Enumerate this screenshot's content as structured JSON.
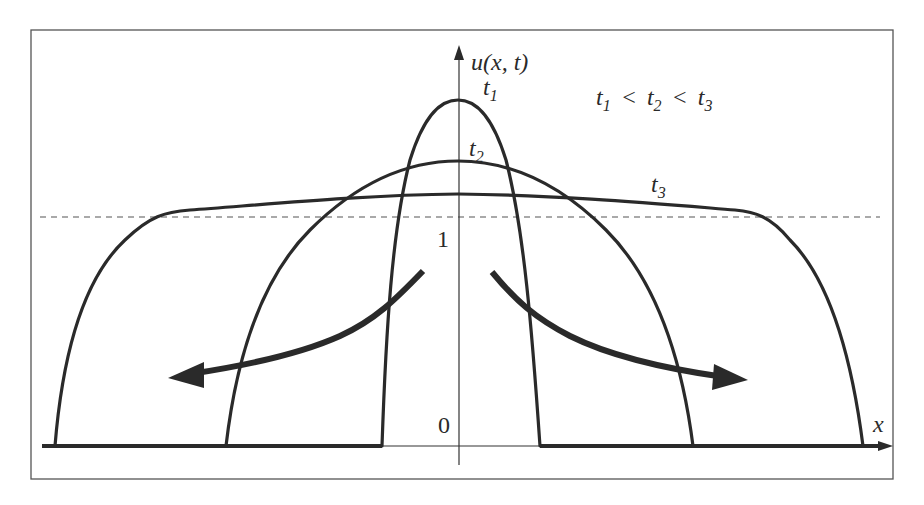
{
  "figure": {
    "y_axis_label": "u(x, t)",
    "x_axis_label": "x",
    "origin_label": "0",
    "level_label": "1",
    "ordering_text": "t1 < t2 < t3",
    "curves": [
      {
        "name": "t1",
        "label": "t",
        "subscript": "1"
      },
      {
        "name": "t2",
        "label": "t",
        "subscript": "2"
      },
      {
        "name": "t3",
        "label": "t",
        "subscript": "3"
      }
    ],
    "ordering": {
      "items": [
        {
          "label": "t",
          "subscript": "1"
        },
        {
          "label": "t",
          "subscript": "2"
        },
        {
          "label": "t",
          "subscript": "3"
        }
      ],
      "separator": "<"
    },
    "annotations": {
      "left_arrow": "spreading outward (left)",
      "right_arrow": "spreading outward (right)",
      "dashed_line": "u = 1 reference level"
    },
    "colors": {
      "curve": "#2a2a2a",
      "frame": "#555555",
      "background": "#ffffff"
    }
  }
}
